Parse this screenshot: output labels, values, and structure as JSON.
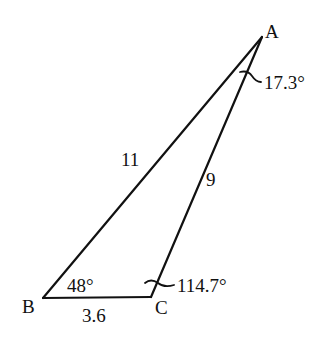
{
  "diagram": {
    "type": "triangle",
    "vertices": {
      "A": {
        "label": "A"
      },
      "B": {
        "label": "B"
      },
      "C": {
        "label": "C"
      }
    },
    "sides": {
      "AB": "11",
      "AC": "9",
      "BC": "3.6"
    },
    "angles": {
      "A": "17.3°",
      "B": "48°",
      "C": "114.7°"
    },
    "stroke_color": "#111111"
  }
}
